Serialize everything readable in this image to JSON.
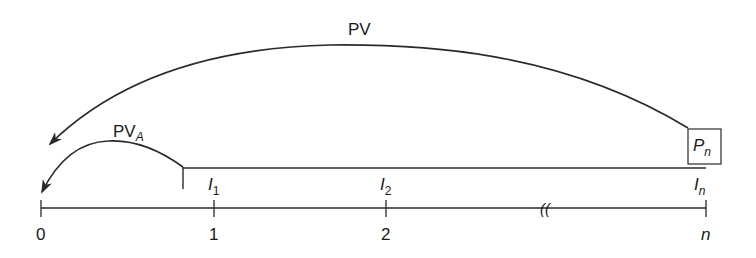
{
  "diagram": {
    "arcs": {
      "pv": {
        "label": "PV"
      },
      "pva": {
        "label_main": "PV",
        "label_sub": "A"
      }
    },
    "terminal_box": {
      "label_main": "P",
      "label_sub": "n"
    },
    "income_labels": [
      {
        "main": "I",
        "sub": "1"
      },
      {
        "main": "I",
        "sub": "2"
      },
      {
        "main": "I",
        "sub": "n"
      }
    ],
    "timeline": {
      "ticks": [
        "0",
        "1",
        "2",
        "n"
      ],
      "break_symbol": "(("
    },
    "colors": {
      "stroke": "#2a2a2a",
      "background": "#ffffff"
    }
  }
}
